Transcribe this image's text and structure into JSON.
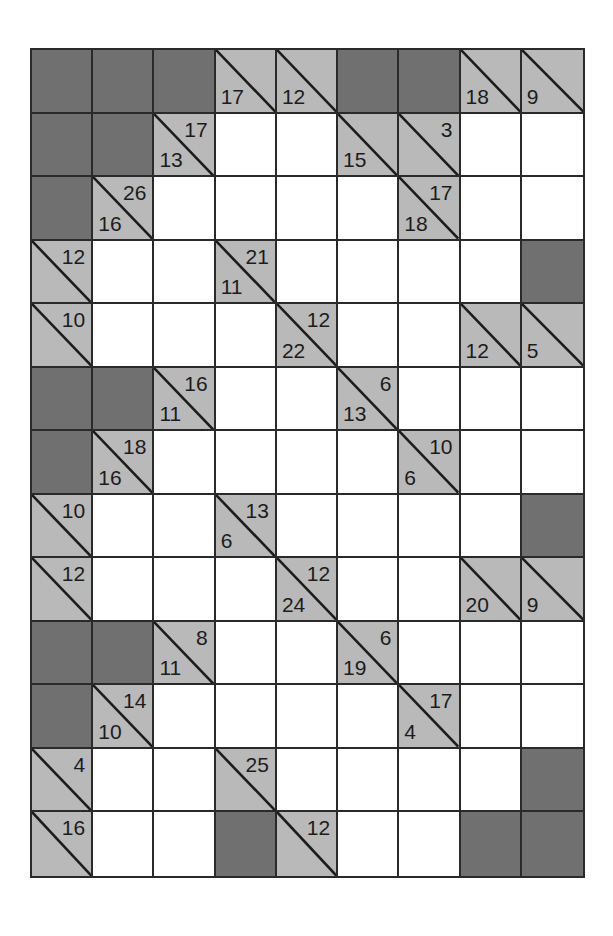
{
  "puzzle": {
    "type": "kakuro",
    "rows": 13,
    "cols": 9,
    "colors": {
      "block": "#707070",
      "clue": "#b9b9b9",
      "empty": "#ffffff",
      "line": "#2a2a2a"
    },
    "legend": {
      "tr": "across sum (upper-right of diagonal)",
      "bl": "down sum (lower-left of diagonal)"
    },
    "grid": [
      [
        {
          "t": "B"
        },
        {
          "t": "B"
        },
        {
          "t": "B"
        },
        {
          "t": "C",
          "bl": "17"
        },
        {
          "t": "C",
          "bl": "12"
        },
        {
          "t": "B"
        },
        {
          "t": "B"
        },
        {
          "t": "C",
          "bl": "18"
        },
        {
          "t": "C",
          "bl": "9"
        }
      ],
      [
        {
          "t": "B"
        },
        {
          "t": "B"
        },
        {
          "t": "C",
          "tr": "17",
          "bl": "13"
        },
        {
          "t": "W"
        },
        {
          "t": "W"
        },
        {
          "t": "C",
          "bl": "15"
        },
        {
          "t": "C",
          "tr": "3"
        },
        {
          "t": "W"
        },
        {
          "t": "W"
        }
      ],
      [
        {
          "t": "B"
        },
        {
          "t": "C",
          "tr": "26",
          "bl": "16"
        },
        {
          "t": "W"
        },
        {
          "t": "W"
        },
        {
          "t": "W"
        },
        {
          "t": "W"
        },
        {
          "t": "C",
          "tr": "17",
          "bl": "18"
        },
        {
          "t": "W"
        },
        {
          "t": "W"
        }
      ],
      [
        {
          "t": "C",
          "tr": "12"
        },
        {
          "t": "W"
        },
        {
          "t": "W"
        },
        {
          "t": "C",
          "tr": "21",
          "bl": "11"
        },
        {
          "t": "W"
        },
        {
          "t": "W"
        },
        {
          "t": "W"
        },
        {
          "t": "W"
        },
        {
          "t": "B"
        }
      ],
      [
        {
          "t": "C",
          "tr": "10"
        },
        {
          "t": "W"
        },
        {
          "t": "W"
        },
        {
          "t": "W"
        },
        {
          "t": "C",
          "tr": "12",
          "bl": "22"
        },
        {
          "t": "W"
        },
        {
          "t": "W"
        },
        {
          "t": "C",
          "bl": "12"
        },
        {
          "t": "C",
          "bl": "5"
        }
      ],
      [
        {
          "t": "B"
        },
        {
          "t": "B"
        },
        {
          "t": "C",
          "tr": "16",
          "bl": "11"
        },
        {
          "t": "W"
        },
        {
          "t": "W"
        },
        {
          "t": "C",
          "tr": "6",
          "bl": "13"
        },
        {
          "t": "W"
        },
        {
          "t": "W"
        },
        {
          "t": "W"
        }
      ],
      [
        {
          "t": "B"
        },
        {
          "t": "C",
          "tr": "18",
          "bl": "16"
        },
        {
          "t": "W"
        },
        {
          "t": "W"
        },
        {
          "t": "W"
        },
        {
          "t": "W"
        },
        {
          "t": "C",
          "tr": "10",
          "bl": "6"
        },
        {
          "t": "W"
        },
        {
          "t": "W"
        }
      ],
      [
        {
          "t": "C",
          "tr": "10"
        },
        {
          "t": "W"
        },
        {
          "t": "W"
        },
        {
          "t": "C",
          "tr": "13",
          "bl": "6"
        },
        {
          "t": "W"
        },
        {
          "t": "W"
        },
        {
          "t": "W"
        },
        {
          "t": "W"
        },
        {
          "t": "B"
        }
      ],
      [
        {
          "t": "C",
          "tr": "12"
        },
        {
          "t": "W"
        },
        {
          "t": "W"
        },
        {
          "t": "W"
        },
        {
          "t": "C",
          "tr": "12",
          "bl": "24"
        },
        {
          "t": "W"
        },
        {
          "t": "W"
        },
        {
          "t": "C",
          "bl": "20"
        },
        {
          "t": "C",
          "bl": "9"
        }
      ],
      [
        {
          "t": "B"
        },
        {
          "t": "B"
        },
        {
          "t": "C",
          "tr": "8",
          "bl": "11"
        },
        {
          "t": "W"
        },
        {
          "t": "W"
        },
        {
          "t": "C",
          "tr": "6",
          "bl": "19"
        },
        {
          "t": "W"
        },
        {
          "t": "W"
        },
        {
          "t": "W"
        }
      ],
      [
        {
          "t": "B"
        },
        {
          "t": "C",
          "tr": "14",
          "bl": "10"
        },
        {
          "t": "W"
        },
        {
          "t": "W"
        },
        {
          "t": "W"
        },
        {
          "t": "W"
        },
        {
          "t": "C",
          "tr": "17",
          "bl": "4"
        },
        {
          "t": "W"
        },
        {
          "t": "W"
        }
      ],
      [
        {
          "t": "C",
          "tr": "4"
        },
        {
          "t": "W"
        },
        {
          "t": "W"
        },
        {
          "t": "C",
          "tr": "25"
        },
        {
          "t": "W"
        },
        {
          "t": "W"
        },
        {
          "t": "W"
        },
        {
          "t": "W"
        },
        {
          "t": "B"
        }
      ],
      [
        {
          "t": "C",
          "tr": "16"
        },
        {
          "t": "W"
        },
        {
          "t": "W"
        },
        {
          "t": "B"
        },
        {
          "t": "C",
          "tr": "12"
        },
        {
          "t": "W"
        },
        {
          "t": "W"
        },
        {
          "t": "B"
        },
        {
          "t": "B"
        }
      ]
    ]
  }
}
